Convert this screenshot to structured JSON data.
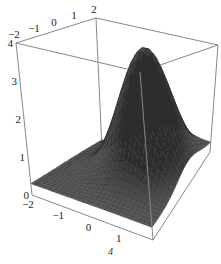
{
  "chart_data": {
    "type": "surface3d",
    "title": "",
    "function_description": "smooth single-peaked bump centered near (0.5, 0.5), max ~4",
    "x": {
      "label": "",
      "range": [
        -2,
        2
      ],
      "ticks": [
        -2,
        -1,
        0,
        1,
        2
      ]
    },
    "y": {
      "label": "",
      "range": [
        -2,
        2
      ],
      "ticks": [
        -2,
        -1,
        0,
        1,
        2
      ]
    },
    "z": {
      "label": "",
      "range": [
        0,
        4
      ],
      "ticks": [
        0,
        1,
        2,
        3,
        4
      ]
    },
    "peak": {
      "x": 0.5,
      "y": 0.6,
      "z": 3.9
    },
    "base_height_at_edges": 0.3,
    "mesh_resolution": 28,
    "surface_color": "#4a4a4a",
    "mesh_line_color": "#222222",
    "box_color": "#888888",
    "grid": false,
    "legend": null
  },
  "caption": "4"
}
